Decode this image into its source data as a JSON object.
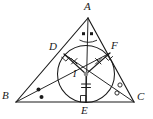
{
  "figure": {
    "type": "geometry-diagram",
    "background_color": "#ffffff",
    "stroke_color": "#1a1a1a",
    "mark_color": "#1a1a1a",
    "incenter_dot_color": "#8c8c8c"
  },
  "labels": {
    "a": "A",
    "b": "B",
    "c": "C",
    "d": "D",
    "e": "E",
    "f": "F",
    "i": "I"
  },
  "points": {
    "A": {
      "x": 88,
      "y": 18
    },
    "B": {
      "x": 16,
      "y": 102
    },
    "C": {
      "x": 134,
      "y": 102
    },
    "D": {
      "x": 64,
      "y": 54
    },
    "E": {
      "x": 86,
      "y": 102
    },
    "F": {
      "x": 110,
      "y": 53
    },
    "I": {
      "x": 86,
      "y": 74
    }
  },
  "incircle": {
    "center_x": 86,
    "center_y": 74,
    "radius": 28.5
  },
  "label_positions": {
    "A": {
      "x": 84,
      "y": 2
    },
    "B": {
      "x": 3,
      "y": 92
    },
    "C": {
      "x": 138,
      "y": 93
    },
    "D": {
      "x": 51,
      "y": 42
    },
    "E": {
      "x": 82,
      "y": 105
    },
    "F": {
      "x": 112,
      "y": 41
    },
    "I": {
      "x": 74,
      "y": 70
    }
  },
  "marks": {
    "angle_a": {
      "name": "equal-angle-dots-at-A",
      "count": 2,
      "glyph": "square-dot"
    },
    "angle_b": {
      "name": "equal-angle-dots-at-B",
      "count": 2,
      "glyph": "filled-dot"
    },
    "angle_c": {
      "name": "equal-angle-circles-at-C",
      "count": 2,
      "glyph": "open-circle"
    },
    "radius_id": {
      "name": "congruence-tick-ID",
      "glyph": "cross-tick"
    },
    "radius_if": {
      "name": "congruence-tick-IF",
      "glyph": "cross-tick"
    },
    "radius_ie": {
      "name": "congruence-tick-IE",
      "glyph": "double-bar-tick"
    },
    "right_angle_d": {
      "name": "right-angle-at-D"
    },
    "right_angle_e": {
      "name": "right-angle-at-E"
    },
    "right_angle_f": {
      "name": "right-angle-at-F"
    }
  },
  "segments": [
    {
      "name": "side-AB",
      "from": "A",
      "to": "B"
    },
    {
      "name": "side-BC",
      "from": "B",
      "to": "C"
    },
    {
      "name": "side-CA",
      "from": "C",
      "to": "A"
    },
    {
      "name": "bisector-AE",
      "from": "A",
      "to": "E"
    },
    {
      "name": "bisector-BF",
      "from": "B",
      "to": "F"
    },
    {
      "name": "bisector-CD",
      "from": "C",
      "to": "D"
    },
    {
      "name": "radius-ID",
      "from": "I",
      "to": "D"
    },
    {
      "name": "radius-IE",
      "from": "I",
      "to": "E"
    },
    {
      "name": "radius-IF",
      "from": "I",
      "to": "F"
    }
  ]
}
